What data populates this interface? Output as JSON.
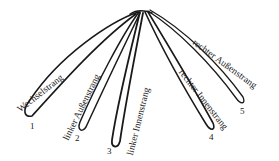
{
  "diagram": {
    "type": "strand-fan",
    "origin": [
      140,
      12
    ],
    "stroke_color": "#1a1a1a",
    "strands": [
      {
        "number": "1",
        "label": "Wechselstrang",
        "tip": [
          25,
          115
        ]
      },
      {
        "number": "2",
        "label": "linker Außenstrang",
        "tip": [
          80,
          130
        ]
      },
      {
        "number": "3",
        "label": "linker Innenstrang",
        "tip": [
          115,
          147
        ]
      },
      {
        "number": "4",
        "label": "rechter Innenstrang",
        "tip": [
          213,
          132
        ]
      },
      {
        "number": "5",
        "label": "rechter Außenstrang",
        "tip": [
          243,
          104
        ]
      }
    ]
  }
}
